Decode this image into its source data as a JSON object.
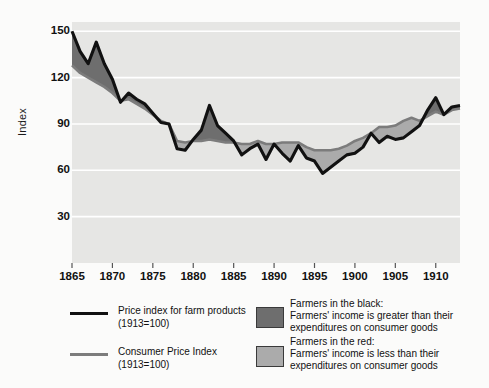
{
  "chart_data": {
    "type": "line",
    "title": "",
    "xlabel": "",
    "ylabel": "Index",
    "xlim": [
      1865,
      1913
    ],
    "ylim": [
      0,
      156
    ],
    "grid": true,
    "yticks": [
      150,
      120,
      90,
      60,
      30
    ],
    "xticks": [
      1865,
      1870,
      1875,
      1880,
      1885,
      1890,
      1895,
      1900,
      1905,
      1910
    ],
    "x": [
      1865,
      1866,
      1867,
      1868,
      1869,
      1870,
      1871,
      1872,
      1873,
      1874,
      1875,
      1876,
      1877,
      1878,
      1879,
      1880,
      1881,
      1882,
      1883,
      1884,
      1885,
      1886,
      1887,
      1888,
      1889,
      1890,
      1891,
      1892,
      1893,
      1894,
      1895,
      1896,
      1897,
      1898,
      1899,
      1900,
      1901,
      1902,
      1903,
      1904,
      1905,
      1906,
      1907,
      1908,
      1909,
      1910,
      1911,
      1912,
      1913
    ],
    "series": [
      {
        "name": "Price index for farm products (1913=100)",
        "color": "#111111",
        "values": [
          150,
          137,
          129,
          143,
          129,
          119,
          104,
          110,
          106,
          103,
          97,
          91,
          90,
          74,
          73,
          80,
          86,
          102,
          89,
          84,
          79,
          70,
          74,
          77,
          67,
          77,
          71,
          66,
          76,
          68,
          66,
          58,
          62,
          66,
          70,
          71,
          75,
          84,
          78,
          82,
          80,
          81,
          85,
          89,
          99,
          107,
          96,
          101,
          102
        ]
      },
      {
        "name": "Consumer Price Index (1913=100)",
        "color": "#7c7c7c",
        "values": [
          128,
          123,
          120,
          117,
          114,
          110,
          105,
          106,
          103,
          100,
          96,
          92,
          90,
          79,
          78,
          79,
          79,
          80,
          79,
          78,
          78,
          77,
          77,
          79,
          77,
          77,
          78,
          78,
          78,
          75,
          73,
          73,
          73,
          74,
          76,
          79,
          81,
          84,
          88,
          88,
          89,
          92,
          94,
          92,
          95,
          98,
          96,
          99,
          100
        ]
      }
    ],
    "fills": [
      {
        "name": "Farmers in the black",
        "color": "#6e6e6e",
        "when": "farm_above_cpi"
      },
      {
        "name": "Farmers in the red",
        "color": "#ababab",
        "when": "farm_below_cpi"
      }
    ],
    "plot_bg": "#e6e6e4",
    "grid_color": "#ffffff"
  },
  "legend": {
    "series_items": [
      {
        "label": "Price index for farm products\n(1913=100)",
        "swatch": "#111111",
        "type": "line"
      },
      {
        "label": "Consumer Price Index\n(1913=100)",
        "swatch": "#7c7c7c",
        "type": "line"
      }
    ],
    "fill_items": [
      {
        "title": "Farmers in the black:",
        "desc": "Farmers' income is greater than their\nexpenditures on consumer goods",
        "swatch": "#6e6e6e"
      },
      {
        "title": "Farmers in the red:",
        "desc": "Farmers' income is less than their\nexpenditures on consumer goods",
        "swatch": "#ababab"
      }
    ]
  }
}
